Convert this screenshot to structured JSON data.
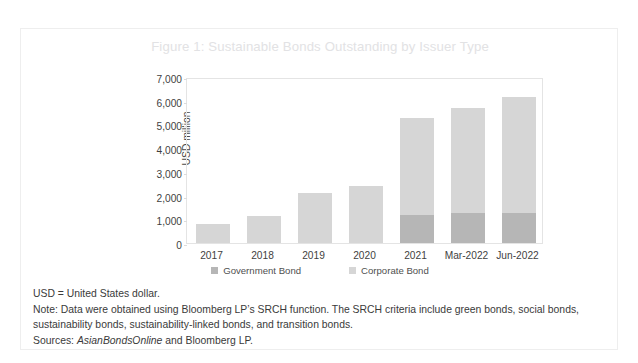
{
  "figure": {
    "title": "Figure 1: Sustainable Bonds Outstanding by Issuer Type",
    "title_color": "#e2e2e4"
  },
  "footnotes": {
    "abbrev": "USD = United States dollar.",
    "note_label": "Note:",
    "note_text": " Data were obtained using Bloomberg LP’s SRCH function. The SRCH criteria include green bonds, social bonds, sustainability bonds, sustainability-linked bonds, and transition bonds.",
    "sources_label": "Sources:",
    "sources_italic": "AsianBondsOnline",
    "sources_rest": " and Bloomberg LP."
  },
  "chart_data": {
    "type": "bar",
    "stacked": true,
    "title": "Figure 1: Sustainable Bonds Outstanding by Issuer Type",
    "xlabel": "",
    "ylabel": "USD million",
    "ylim": [
      0,
      7000
    ],
    "ytick_step": 1000,
    "yticks": [
      "0",
      "1,000",
      "2,000",
      "3,000",
      "4,000",
      "5,000",
      "6,000",
      "7,000"
    ],
    "ytick_values": [
      0,
      1000,
      2000,
      3000,
      4000,
      5000,
      6000,
      7000
    ],
    "grid": false,
    "legend_position": "bottom",
    "categories": [
      "2017",
      "2018",
      "2019",
      "2020",
      "2021",
      "Mar-2022",
      "Jun-2022"
    ],
    "series": [
      {
        "name": "Government Bond",
        "color": "#b6b6b6",
        "values": [
          0,
          0,
          0,
          0,
          1200,
          1250,
          1250
        ]
      },
      {
        "name": "Corporate Bond",
        "color": "#d6d6d6",
        "values": [
          820,
          1150,
          2100,
          2420,
          4080,
          4450,
          4900
        ]
      }
    ],
    "totals": [
      820,
      1150,
      2100,
      2420,
      5280,
      5700,
      6150
    ]
  }
}
